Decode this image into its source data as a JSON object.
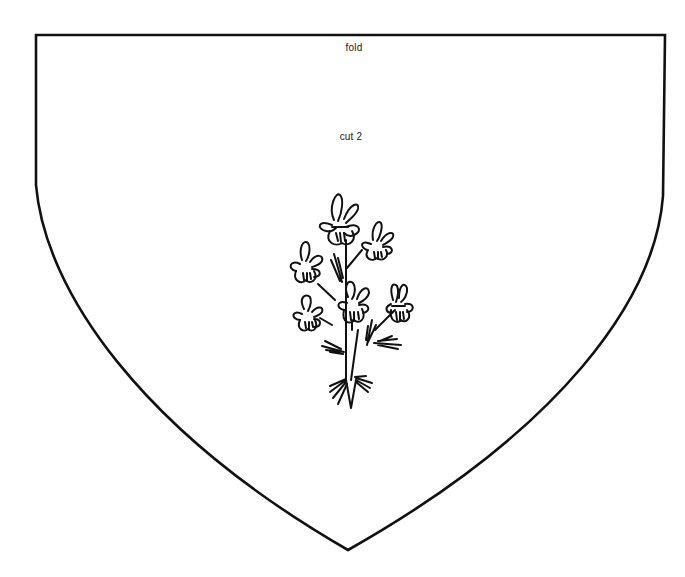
{
  "document": {
    "type": "sewing-pattern-piece",
    "shape": "shield",
    "labels": {
      "fold": "fold",
      "cut": "cut 2"
    },
    "illustration": "flower-sprig-icon",
    "colors": {
      "ink": "#111111",
      "paper": "#ffffff"
    }
  }
}
